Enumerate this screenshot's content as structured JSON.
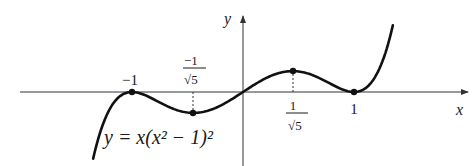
{
  "figure": {
    "equation": "y = x(x² − 1)²",
    "axes": {
      "x_label": "x",
      "y_label": "y"
    },
    "tick_labels": {
      "neg_one": "−1",
      "neg_inv_sqrt5_num": "−1",
      "neg_inv_sqrt5_den": "√5",
      "inv_sqrt5_num": "1",
      "inv_sqrt5_den": "√5",
      "one": "1"
    },
    "colors": {
      "curve": "#111111",
      "axis": "#333333",
      "background": "#ffffff"
    }
  },
  "chart_data": {
    "type": "line",
    "title": "",
    "function": "y = x(x^2 - 1)^2",
    "xlabel": "x",
    "ylabel": "y",
    "xlim": [
      -1.35,
      1.35
    ],
    "marked_points": [
      {
        "x": -1,
        "y": 0,
        "label": "−1"
      },
      {
        "x": -0.447,
        "y": -0.286,
        "label": "−1/√5",
        "dashed_guide": true
      },
      {
        "x": 0.447,
        "y": 0.286,
        "label": "1/√5",
        "dashed_guide": true
      },
      {
        "x": 1,
        "y": 0,
        "label": "1"
      }
    ],
    "grid": false,
    "legend": null
  }
}
